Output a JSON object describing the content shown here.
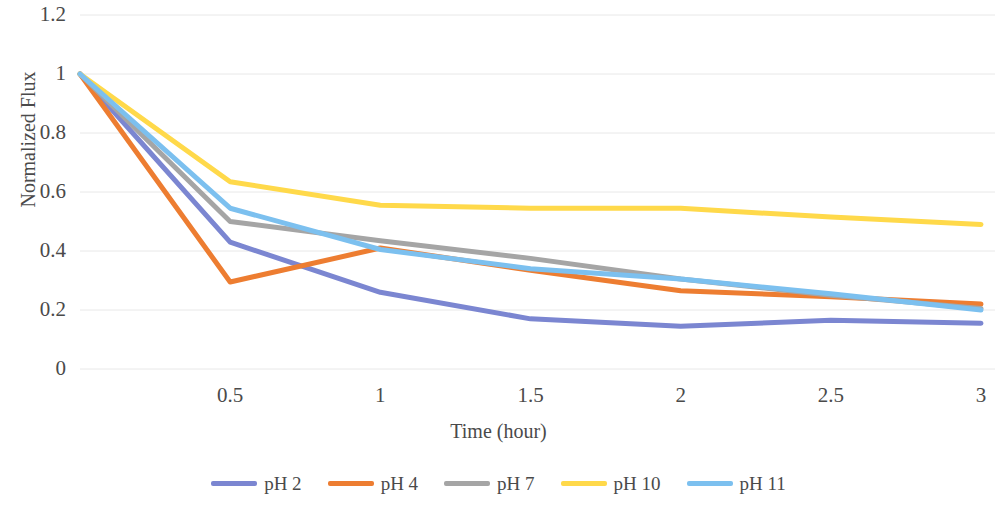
{
  "chart_data": {
    "type": "line",
    "title": "",
    "xlabel": "Time (hour)",
    "ylabel": "Normalized Flux",
    "xlim": [
      0,
      3
    ],
    "ylim": [
      0,
      1.2
    ],
    "grid": true,
    "grid_axis": "y",
    "legend_position": "bottom",
    "x_ticks": [
      "0.5",
      "1",
      "1.5",
      "2",
      "2.5",
      "3"
    ],
    "x_tick_values": [
      0.5,
      1,
      1.5,
      2,
      2.5,
      3
    ],
    "y_ticks": [
      "0",
      "0.2",
      "0.4",
      "0.6",
      "0.8",
      "1",
      "1.2"
    ],
    "y_tick_values": [
      0,
      0.2,
      0.4,
      0.6,
      0.8,
      1,
      1.2
    ],
    "x": [
      0,
      0.5,
      1,
      1.5,
      2,
      2.5,
      3
    ],
    "series": [
      {
        "name": "pH 2",
        "color": "#7B86D1",
        "values": [
          1.0,
          0.43,
          0.26,
          0.17,
          0.145,
          0.165,
          0.155
        ]
      },
      {
        "name": "pH 4",
        "color": "#ED7D31",
        "values": [
          1.0,
          0.295,
          0.41,
          0.335,
          0.265,
          0.245,
          0.22
        ]
      },
      {
        "name": "pH 7",
        "color": "#A5A5A5",
        "values": [
          1.0,
          0.5,
          0.435,
          0.375,
          0.305,
          0.25,
          0.205
        ]
      },
      {
        "name": "pH 10",
        "color": "#FFD94A",
        "values": [
          1.0,
          0.635,
          0.555,
          0.545,
          0.545,
          0.515,
          0.49
        ]
      },
      {
        "name": "pH 11",
        "color": "#7CC0EF",
        "values": [
          1.0,
          0.545,
          0.405,
          0.34,
          0.305,
          0.255,
          0.2
        ]
      }
    ]
  },
  "axis": {
    "y_title": "Normalized Flux",
    "x_title": "Time (hour)"
  },
  "legend": {
    "items": [
      {
        "label": "pH 2",
        "color": "#7B86D1"
      },
      {
        "label": "pH 4",
        "color": "#ED7D31"
      },
      {
        "label": "pH 7",
        "color": "#A5A5A5"
      },
      {
        "label": "pH 10",
        "color": "#FFD94A"
      },
      {
        "label": "pH 11",
        "color": "#7CC0EF"
      }
    ]
  }
}
